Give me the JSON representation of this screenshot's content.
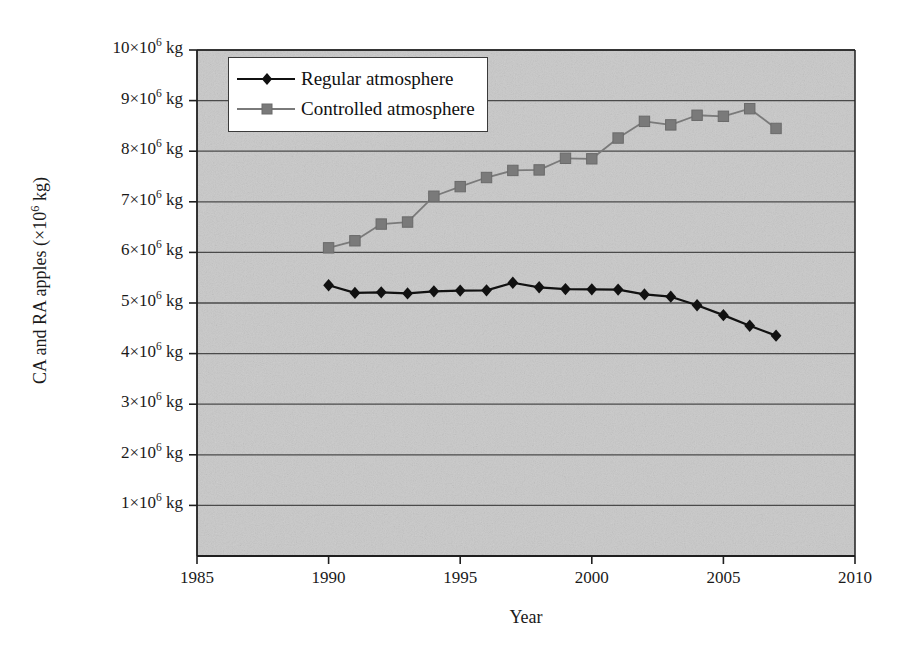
{
  "chart_data": {
    "type": "line",
    "title": "",
    "xlabel": "Year",
    "ylabel": "CA and RA apples (×10⁶ kg)",
    "ylabel_prefix": "CA and RA apples (×10",
    "ylabel_exponent": "6",
    "ylabel_suffix": " kg)",
    "xlim": [
      1985,
      2010
    ],
    "ylim": [
      0,
      10000000
    ],
    "grid": true,
    "grid_axis": "y",
    "legend_position": "upper left",
    "x_ticks": [
      1985,
      1990,
      1995,
      2000,
      2005,
      2010
    ],
    "x_tick_labels": [
      "1985",
      "1990",
      "1995",
      "2000",
      "2005",
      "2010"
    ],
    "y_ticks": [
      1000000,
      2000000,
      3000000,
      4000000,
      5000000,
      6000000,
      7000000,
      8000000,
      9000000,
      10000000
    ],
    "y_tick_labels": [
      "1×10⁶ kg",
      "2×10⁶ kg",
      "3×10⁶ kg",
      "4×10⁶ kg",
      "5×10⁶ kg",
      "6×10⁶ kg",
      "7×10⁶ kg",
      "8×10⁶ kg",
      "9×10⁶ kg",
      "10×10⁶ kg"
    ],
    "y_tick_parts": [
      {
        "mantissa": "1",
        "exp": "6",
        "unit": " kg"
      },
      {
        "mantissa": "2",
        "exp": "6",
        "unit": " kg"
      },
      {
        "mantissa": "3",
        "exp": "6",
        "unit": " kg"
      },
      {
        "mantissa": "4",
        "exp": "6",
        "unit": " kg"
      },
      {
        "mantissa": "5",
        "exp": "6",
        "unit": " kg"
      },
      {
        "mantissa": "6",
        "exp": "6",
        "unit": " kg"
      },
      {
        "mantissa": "7",
        "exp": "6",
        "unit": " kg"
      },
      {
        "mantissa": "8",
        "exp": "6",
        "unit": " kg"
      },
      {
        "mantissa": "9",
        "exp": "6",
        "unit": " kg"
      },
      {
        "mantissa": "10",
        "exp": "6",
        "unit": " kg"
      }
    ],
    "x": [
      1990,
      1991,
      1992,
      1993,
      1994,
      1995,
      1996,
      1997,
      1998,
      1999,
      2000,
      2001,
      2002,
      2003,
      2004,
      2005,
      2006,
      2007
    ],
    "series": [
      {
        "name": "Regular atmosphere",
        "color": "#111111",
        "marker": "diamond",
        "values": [
          5350000,
          5200000,
          5210000,
          5190000,
          5230000,
          5245000,
          5250000,
          5400000,
          5310000,
          5275000,
          5270000,
          5265000,
          5170000,
          5125000,
          4955000,
          4760000,
          4550000,
          4355000
        ]
      },
      {
        "name": "Controlled atmosphere",
        "color": "#7a7a7a",
        "marker": "square",
        "values": [
          6090000,
          6230000,
          6560000,
          6600000,
          7110000,
          7300000,
          7480000,
          7620000,
          7630000,
          7860000,
          7850000,
          8260000,
          8590000,
          8520000,
          8710000,
          8690000,
          8840000,
          8450000
        ]
      }
    ]
  },
  "legend": {
    "items": [
      {
        "label": "Regular atmosphere",
        "marker": "diamond",
        "color": "#111111"
      },
      {
        "label": "Controlled atmosphere",
        "marker": "square",
        "color": "#7a7a7a"
      }
    ]
  },
  "style": {
    "plot_background": "#c9c9c9",
    "grid_color": "#4a4a4a",
    "axis_color": "#1f1f1f",
    "page_background": "#ffffff"
  }
}
